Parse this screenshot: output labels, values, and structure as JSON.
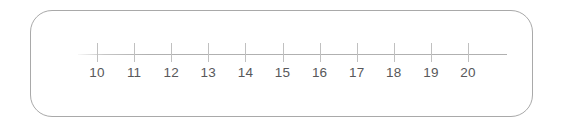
{
  "card": {
    "border_color": "#a9a9a9",
    "background_color": "#ffffff",
    "corner_radius_px": 22
  },
  "chart_data": {
    "type": "line",
    "title": "",
    "subtitle": "",
    "xlabel": "",
    "ylabel": "",
    "orientation": "horizontal",
    "grid": false,
    "legend": null,
    "annotations": [],
    "axis_color": "#b0b0b0",
    "tick_color": "#c0c0c0",
    "label_color": "#58585a",
    "xlim": [
      10,
      20
    ],
    "tick_step": 1,
    "tick_labels": [
      "10",
      "11",
      "12",
      "13",
      "14",
      "15",
      "16",
      "17",
      "18",
      "19",
      "20"
    ],
    "tick_values": [
      10,
      11,
      12,
      13,
      14,
      15,
      16,
      17,
      18,
      19,
      20
    ],
    "axis_start_px": 78,
    "axis_end_px": 507,
    "first_tick_px": 97,
    "tick_spacing_px": 37.1,
    "axis_y_px": 54,
    "series": []
  }
}
